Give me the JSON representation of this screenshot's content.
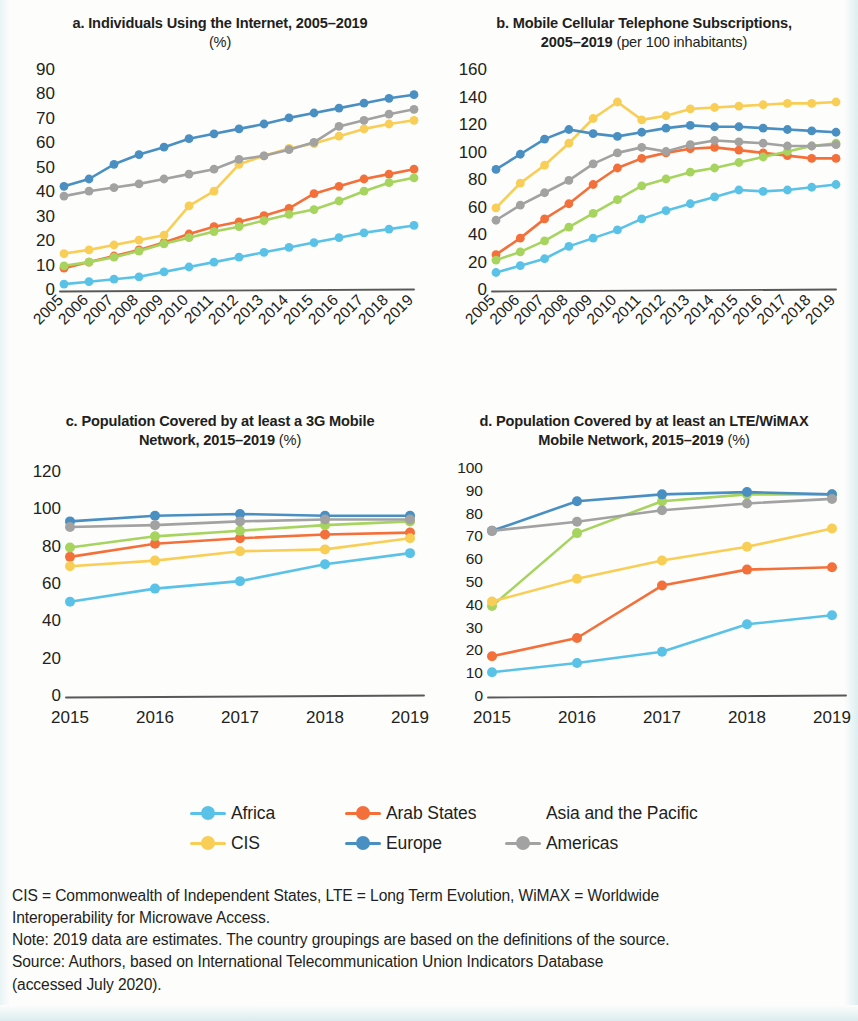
{
  "colors": {
    "africa": "#5BC2E7",
    "arab_states": "#F4703A",
    "asia_pacific": "#A6D45E",
    "cis": "#F9CE56",
    "europe": "#4A8FC2",
    "americas": "#A2A2A2",
    "axis": "#585858",
    "text": "#231f20"
  },
  "legend": {
    "items": [
      {
        "label": "Africa",
        "key": "africa"
      },
      {
        "label": "Arab States",
        "key": "arab_states"
      },
      {
        "label": "Asia and the Pacific",
        "key": "asia_pacific"
      },
      {
        "label": "CIS",
        "key": "cis"
      },
      {
        "label": "Europe",
        "key": "europe"
      },
      {
        "label": "Americas",
        "key": "americas"
      }
    ]
  },
  "footnote": {
    "line1": "CIS = Commonwealth of Independent States, LTE = Long Term Evolution, WiMAX = Worldwide",
    "line2": "Interoperability for Microwave Access.",
    "line3": "Note: 2019 data are estimates. The country groupings are based on the definitions of the source.",
    "line4": "Source: Authors, based on International Telecommunication Union Indicators Database",
    "line5": "(accessed July 2020)."
  },
  "chart_data": [
    {
      "id": "a",
      "type": "line",
      "title": "a. Individuals Using the Internet, 2005–2019",
      "subtitle": "(%)",
      "unit": "(%)",
      "xlabel": "",
      "ylabel": "",
      "x": [
        2005,
        2006,
        2007,
        2008,
        2009,
        2010,
        2011,
        2012,
        2013,
        2014,
        2015,
        2016,
        2017,
        2018,
        2019
      ],
      "categories": [
        "2005",
        "2006",
        "2007",
        "2008",
        "2009",
        "2010",
        "2011",
        "2012",
        "2013",
        "2014",
        "2015",
        "2016",
        "2017",
        "2018",
        "2019"
      ],
      "ylim": [
        0,
        90
      ],
      "yticks": [
        0,
        10,
        20,
        30,
        40,
        50,
        60,
        70,
        80,
        90
      ],
      "grid": false,
      "legend_position": "bottom-shared",
      "xtick_rotation": -45,
      "series": [
        {
          "name": "Africa",
          "key": "africa",
          "values": [
            2,
            3,
            4,
            5,
            7,
            9,
            11,
            13,
            15,
            17,
            19,
            21,
            23,
            24.5,
            26
          ]
        },
        {
          "name": "Arab States",
          "key": "arab_states",
          "values": [
            8.5,
            11,
            13.5,
            16,
            19,
            22.5,
            25.5,
            27.5,
            30,
            33,
            39,
            42,
            45,
            47,
            49
          ]
        },
        {
          "name": "Asia and the Pacific",
          "key": "asia_pacific",
          "values": [
            9.5,
            11,
            13,
            15.5,
            18.5,
            21,
            23.5,
            25.5,
            28,
            30.5,
            32.5,
            36,
            40,
            43.5,
            45.5
          ]
        },
        {
          "name": "CIS",
          "key": "cis",
          "values": [
            14.5,
            16,
            18,
            20,
            22,
            34,
            40,
            51,
            54.5,
            57.5,
            59.5,
            62.5,
            65.5,
            67.5,
            69
          ]
        },
        {
          "name": "Europe",
          "key": "europe",
          "values": [
            42,
            45,
            51,
            55,
            58,
            61.5,
            63.5,
            65.5,
            67.5,
            70,
            72,
            74,
            76,
            78,
            79.5
          ]
        },
        {
          "name": "Americas",
          "key": "americas",
          "values": [
            38,
            40,
            41.5,
            43,
            45,
            47,
            49,
            53,
            54.5,
            57,
            60,
            66.5,
            69,
            71.5,
            73.5
          ]
        }
      ]
    },
    {
      "id": "b",
      "type": "line",
      "title": "b. Mobile Cellular Telephone Subscriptions, 2005–2019",
      "subtitle": "(per 100 inhabitants)",
      "unit": "(per 100 inhabitants)",
      "xlabel": "",
      "ylabel": "",
      "x": [
        2005,
        2006,
        2007,
        2008,
        2009,
        2010,
        2011,
        2012,
        2013,
        2014,
        2015,
        2016,
        2017,
        2018,
        2019
      ],
      "categories": [
        "2005",
        "2006",
        "2007",
        "2008",
        "2009",
        "2010",
        "2011",
        "2012",
        "2013",
        "2014",
        "2015",
        "2016",
        "2017",
        "2018",
        "2019"
      ],
      "ylim": [
        0,
        160
      ],
      "yticks": [
        0,
        20,
        40,
        60,
        80,
        100,
        120,
        140,
        160
      ],
      "grid": false,
      "legend_position": "bottom-shared",
      "xtick_rotation": -45,
      "series": [
        {
          "name": "Africa",
          "key": "africa",
          "values": [
            12,
            17,
            22,
            31,
            37,
            43,
            51,
            57,
            62,
            67,
            72,
            71,
            72,
            74,
            76
          ]
        },
        {
          "name": "Arab States",
          "key": "arab_states",
          "values": [
            25,
            37,
            51,
            62,
            76,
            88,
            95,
            99,
            102,
            103,
            101,
            99,
            97,
            95,
            95
          ]
        },
        {
          "name": "Asia and the Pacific",
          "key": "asia_pacific",
          "values": [
            21,
            27,
            35,
            45,
            55,
            65,
            75,
            80,
            85,
            88,
            92,
            96,
            100,
            104,
            106
          ]
        },
        {
          "name": "CIS",
          "key": "cis",
          "values": [
            59,
            77,
            90,
            106,
            124,
            136,
            123,
            126,
            131,
            132,
            133,
            134,
            135,
            135,
            136
          ]
        },
        {
          "name": "Europe",
          "key": "europe",
          "values": [
            87,
            98,
            109,
            116,
            113,
            111,
            114,
            117,
            119,
            118,
            118,
            117,
            116,
            115,
            114
          ]
        },
        {
          "name": "Americas",
          "key": "americas",
          "values": [
            50,
            61,
            70,
            79,
            91,
            99,
            103,
            100,
            105,
            108,
            107,
            106,
            104,
            104,
            105
          ]
        }
      ]
    },
    {
      "id": "c",
      "type": "line",
      "title": "c. Population Covered by at least a 3G Mobile Network, 2015–2019",
      "subtitle": "(%)",
      "unit": "(%)",
      "xlabel": "",
      "ylabel": "",
      "x": [
        2015,
        2016,
        2017,
        2018,
        2019
      ],
      "categories": [
        "2015",
        "2016",
        "2017",
        "2018",
        "2019"
      ],
      "ylim": [
        0,
        120
      ],
      "yticks": [
        0,
        20,
        40,
        60,
        80,
        100,
        120
      ],
      "grid": false,
      "legend_position": "bottom-shared",
      "xtick_rotation": 0,
      "series": [
        {
          "name": "Africa",
          "key": "africa",
          "values": [
            50,
            57,
            61,
            70,
            76
          ]
        },
        {
          "name": "Arab States",
          "key": "arab_states",
          "values": [
            74,
            81,
            84,
            86,
            87
          ]
        },
        {
          "name": "Asia and the Pacific",
          "key": "asia_pacific",
          "values": [
            79,
            85,
            88,
            91,
            93
          ]
        },
        {
          "name": "CIS",
          "key": "cis",
          "values": [
            69,
            72,
            77,
            78,
            84
          ]
        },
        {
          "name": "Europe",
          "key": "europe",
          "values": [
            93,
            96,
            97,
            96,
            96
          ]
        },
        {
          "name": "Americas",
          "key": "americas",
          "values": [
            90,
            91,
            93,
            94,
            94
          ]
        }
      ]
    },
    {
      "id": "d",
      "type": "line",
      "title": "d. Population Covered by at least an LTE/WiMAX Mobile Network, 2015–2019",
      "subtitle": "(%)",
      "unit": "(%)",
      "xlabel": "",
      "ylabel": "",
      "x": [
        2015,
        2016,
        2017,
        2018,
        2019
      ],
      "categories": [
        "2015",
        "2016",
        "2017",
        "2018",
        "2019"
      ],
      "ylim": [
        0,
        100
      ],
      "yticks": [
        0,
        10,
        20,
        30,
        40,
        50,
        60,
        70,
        80,
        90,
        100
      ],
      "grid": false,
      "legend_position": "bottom-shared",
      "xtick_rotation": 0,
      "series": [
        {
          "name": "Africa",
          "key": "africa",
          "values": [
            10,
            14,
            19,
            31,
            35
          ]
        },
        {
          "name": "Arab States",
          "key": "arab_states",
          "values": [
            17,
            25,
            48,
            55,
            56
          ]
        },
        {
          "name": "Asia and the Pacific",
          "key": "asia_pacific",
          "values": [
            39,
            71,
            85,
            88,
            88
          ]
        },
        {
          "name": "CIS",
          "key": "cis",
          "values": [
            41,
            51,
            59,
            65,
            73
          ]
        },
        {
          "name": "Europe",
          "key": "europe",
          "values": [
            72,
            85,
            88,
            89,
            88
          ]
        },
        {
          "name": "Americas",
          "key": "americas",
          "values": [
            72,
            76,
            81,
            84,
            86
          ]
        }
      ]
    }
  ]
}
